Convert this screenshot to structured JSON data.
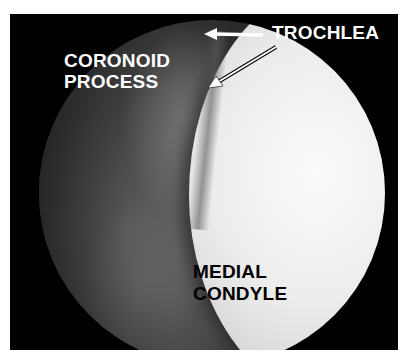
{
  "image": {
    "description": "Arthroscopic view of elbow joint",
    "labels": {
      "trochlea": "TROCHLEA",
      "coronoid_line1": "CORONOID",
      "coronoid_line2": "PROCESS",
      "medial_line1": "MEDIAL",
      "medial_line2": "CONDYLE"
    },
    "colors": {
      "frame": "#000000",
      "background": "#ffffff",
      "condyle": "#f2f2f2",
      "coronoid": "#5a5a5a",
      "label_light": "#ffffff",
      "label_dark": "#000000"
    }
  }
}
